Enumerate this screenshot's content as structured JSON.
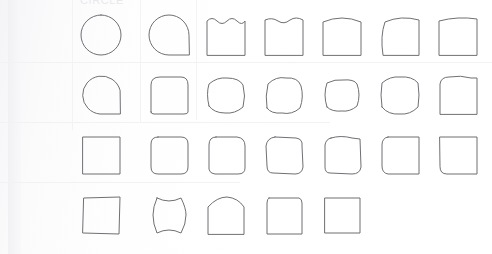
{
  "page": {
    "title_remnant": "CIRCLE",
    "background_color": "#fdfdfd",
    "stroke_color": "#6f6f75",
    "gridline_color": "#f2f2f4"
  },
  "grid": {
    "columns": 7,
    "rows": 4,
    "col_x": [
      80,
      148,
      205,
      263,
      321,
      379,
      437
    ],
    "row_y": [
      14,
      74,
      134,
      194
    ],
    "cell_size": 42
  },
  "chart_data": {
    "type": "table",
    "xlabel": "",
    "ylabel": "",
    "shapes": [
      {
        "row": 1,
        "col": 1,
        "name": "circle",
        "path": "M 21 1 A 20 20 0 1 0 21 41 A 20 20 0 1 0 21 1 Z"
      },
      {
        "row": 1,
        "col": 2,
        "name": "circle-one-square-corner",
        "path": "M 41 21 A 20 20 0 1 0 21 41 L 41 41 Z"
      },
      {
        "row": 1,
        "col": 3,
        "name": "square-scalloped-top",
        "path": "M 2 41 L 2 7 Q 7 2 12 7 Q 17 12 22 7 Q 27 2 32 7 Q 37 12 40 7 L 40 41 Z"
      },
      {
        "row": 1,
        "col": 4,
        "name": "square-wavy-top",
        "path": "M 2 41 L 2 6 Q 9 3 15 7 Q 21 11 27 6 Q 33 2 40 6 L 40 41 Z"
      },
      {
        "row": 1,
        "col": 5,
        "name": "square-arched-top",
        "path": "M 2 41 L 2 8 Q 21 0 40 8 L 40 41 Z"
      },
      {
        "row": 1,
        "col": 6,
        "name": "square-bulging-left-top",
        "path": "M 4 41 Q 1 22 6 8 Q 22 1 40 6 L 40 41 Z"
      },
      {
        "row": 1,
        "col": 7,
        "name": "square-curved-top",
        "path": "M 2 41 L 2 7 Q 21 2 40 5 L 40 41 Z"
      },
      {
        "row": 2,
        "col": 1,
        "name": "circle-square-right",
        "path": "M 40 16 A 19 19 0 1 0 20 40 L 40 40 Z"
      },
      {
        "row": 2,
        "col": 2,
        "name": "rounded-square-large-radius",
        "path": "M 3 38 L 3 11 Q 3 3 12 3 L 33 3 Q 40 3 40 11 L 40 38 Q 40 40 36 40 L 6 40 Q 3 40 3 38 Z"
      },
      {
        "row": 2,
        "col": 3,
        "name": "rounded-square-soft",
        "path": "M 4 32 Q 1 20 4 10 Q 12 3 22 4 Q 34 4 38 11 Q 41 22 38 33 Q 30 40 20 39 Q 9 39 4 32 Z"
      },
      {
        "row": 2,
        "col": 4,
        "name": "rounded-square-notched",
        "path": "M 4 34 Q 2 22 5 10 Q 13 2 23 4 Q 35 3 38 12 Q 41 23 37 34 Q 29 41 19 39 Q 8 40 4 34 Z"
      },
      {
        "row": 2,
        "col": 5,
        "name": "rounded-square-concave-sides",
        "path": "M 6 33 Q 2 21 6 9 Q 14 5 22 6 Q 33 5 36 10 Q 40 21 36 32 Q 29 38 21 37 Q 11 38 6 33 Z"
      },
      {
        "row": 2,
        "col": 6,
        "name": "squircle",
        "path": "M 3 33 Q 1 21 3 9 Q 11 2 21 3 Q 33 2 39 9 Q 41 21 39 33 Q 31 41 21 40 Q 9 41 3 33 Z"
      },
      {
        "row": 2,
        "col": 7,
        "name": "square-rounded-upper-left",
        "path": "M 3 40 L 3 10 Q 4 3 12 3 Q 24 1 34 4 L 40 4 L 40 40 Z"
      },
      {
        "row": 3,
        "col": 1,
        "name": "square-sharp",
        "path": "M 3 3 L 40 3 L 40 40 L 3 40 Z"
      },
      {
        "row": 3,
        "col": 2,
        "name": "rounded-square-small-radius",
        "path": "M 10 3 L 33 3 Q 40 3 40 10 L 40 33 Q 40 40 33 40 L 10 40 Q 3 40 3 33 L 3 10 Q 3 3 10 3 Z"
      },
      {
        "row": 3,
        "col": 3,
        "name": "rounded-square-uneven",
        "path": "M 11 3 L 32 3 Q 40 4 40 12 L 40 34 Q 40 40 33 40 L 10 40 Q 3 39 4 32 L 4 11 Q 4 3 11 3 Z"
      },
      {
        "row": 3,
        "col": 4,
        "name": "rounded-square-wobble",
        "path": "M 12 3 L 33 4 Q 40 5 39 12 L 40 33 Q 39 40 32 40 L 10 39 Q 4 39 4 32 L 3 12 Q 4 4 12 3 Z"
      },
      {
        "row": 3,
        "col": 5,
        "name": "square-rough-edges",
        "path": "M 10 4 Q 20 1 31 4 L 39 5 L 40 33 Q 39 40 31 40 L 9 39 Q 4 39 4 33 L 4 11 Q 5 5 10 4 Z"
      },
      {
        "row": 3,
        "col": 6,
        "name": "square-rounded-left",
        "path": "M 9 3 L 40 3 L 40 40 L 9 40 Q 3 39 3 32 L 3 11 Q 3 4 9 3 Z"
      },
      {
        "row": 3,
        "col": 7,
        "name": "square-rounded-lower-left",
        "path": "M 3 3 L 40 3 L 40 40 L 10 40 Q 3 40 3 33 Z"
      },
      {
        "row": 4,
        "col": 1,
        "name": "square-hand-drawn",
        "path": "M 4 4 L 40 3 L 39 40 L 3 39 Z"
      },
      {
        "row": 4,
        "col": 2,
        "name": "concave-pillow",
        "path": "M 9 4 Q 21 10 33 4 Q 38 14 38 21 Q 38 30 33 39 Q 21 33 9 39 Q 5 30 5 21 Q 5 13 9 4 Z"
      },
      {
        "row": 4,
        "col": 3,
        "name": "square-domed-top",
        "path": "M 3 40 L 3 13 Q 12 3 22 3 Q 33 4 39 13 L 39 40 Z"
      },
      {
        "row": 4,
        "col": 4,
        "name": "square-slightly-rounded",
        "path": "M 6 4 L 36 4 Q 39 5 39 9 L 39 40 L 4 40 L 4 9 Q 4 5 6 4 Z"
      },
      {
        "row": 4,
        "col": 5,
        "name": "square-plain",
        "path": "M 4 4 L 39 4 L 39 39 L 4 39 Z"
      }
    ]
  }
}
